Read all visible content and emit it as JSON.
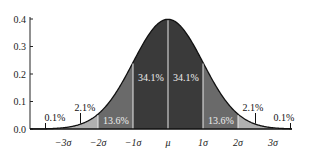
{
  "chart_data": {
    "type": "area",
    "title": "",
    "xlabel": "",
    "ylabel": "",
    "ylim": [
      0,
      0.4
    ],
    "xlim": [
      -4,
      4
    ],
    "yticks": [
      0.0,
      0.1,
      0.2,
      0.3,
      0.4
    ],
    "ytick_labels": [
      "0.0",
      "0.1",
      "0.2",
      "0.3",
      "0.4"
    ],
    "xticks": [
      -3,
      -2,
      -1,
      0,
      1,
      2,
      3
    ],
    "xtick_labels": [
      "−3σ",
      "−2σ",
      "−1σ",
      "μ",
      "1σ",
      "2σ",
      "3σ"
    ],
    "curve": "standard normal probability density function",
    "regions": [
      {
        "from": -4,
        "to": -3,
        "label": "0.1%",
        "value": 0.1,
        "color": "#ffffff"
      },
      {
        "from": -3,
        "to": -2,
        "label": "2.1%",
        "value": 2.1,
        "color": "#b0b0b0"
      },
      {
        "from": -2,
        "to": -1,
        "label": "13.6%",
        "value": 13.6,
        "color": "#6a6a6a"
      },
      {
        "from": -1,
        "to": 0,
        "label": "34.1%",
        "value": 34.1,
        "color": "#3a3a3a"
      },
      {
        "from": 0,
        "to": 1,
        "label": "34.1%",
        "value": 34.1,
        "color": "#3a3a3a"
      },
      {
        "from": 1,
        "to": 2,
        "label": "13.6%",
        "value": 13.6,
        "color": "#6a6a6a"
      },
      {
        "from": 2,
        "to": 3,
        "label": "2.1%",
        "value": 2.1,
        "color": "#b0b0b0"
      },
      {
        "from": 3,
        "to": 4,
        "label": "0.1%",
        "value": 0.1,
        "color": "#ffffff"
      }
    ],
    "grid": false,
    "legend": null
  }
}
